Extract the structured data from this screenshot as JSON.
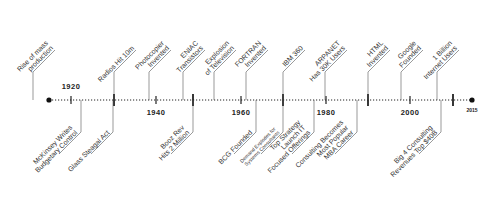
{
  "timeline": {
    "start_label": "",
    "end_label": "2015",
    "axis_color": "#222222",
    "line_color": "#555555",
    "text_color": "#333333",
    "years": [
      {
        "label": "1920",
        "x": 71,
        "pos": "above"
      },
      {
        "label": "1940",
        "x": 156,
        "pos": "below"
      },
      {
        "label": "1960",
        "x": 241,
        "pos": "below"
      },
      {
        "label": "1980",
        "x": 326,
        "pos": "below"
      },
      {
        "label": "2000",
        "x": 410,
        "pos": "below"
      }
    ],
    "top_events": [
      {
        "lines": [
          "Rise of mass",
          "production"
        ],
        "x": 33,
        "tick": false
      },
      {
        "lines": [
          "Radios Hit 10m"
        ],
        "x": 114,
        "tick": true
      },
      {
        "lines": [
          "Photocopier",
          "Invented"
        ],
        "x": 149,
        "tick": false
      },
      {
        "lines": [
          "ENIAC",
          "Transistors"
        ],
        "x": 183,
        "tick": false
      },
      {
        "lines": [
          "Explosion",
          "of Television"
        ],
        "x": 214,
        "tick": false
      },
      {
        "lines": [
          "FORTRAN",
          "Invented"
        ],
        "x": 246,
        "tick": false
      },
      {
        "lines": [
          "IBM 360"
        ],
        "x": 283,
        "tick": true
      },
      {
        "lines": [
          "ARPANET",
          "Has 30K Users"
        ],
        "x": 325,
        "tick": false
      },
      {
        "lines": [
          "HTML",
          "Invented"
        ],
        "x": 368,
        "tick": true
      },
      {
        "lines": [
          "Google",
          "Founded"
        ],
        "x": 401,
        "tick": false
      },
      {
        "lines": [
          "1 Billion",
          "Internet Users"
        ],
        "x": 437,
        "tick": false
      }
    ],
    "bottom_events": [
      {
        "lines": [
          "McKinsey Writes",
          "Budgetary Control"
        ],
        "x": 81,
        "small": false
      },
      {
        "lines": [
          "Glass Steagal Act"
        ],
        "x": 113,
        "small": false
      },
      {
        "lines": [
          "Booz Rev",
          "Hits 2 Million"
        ],
        "x": 193,
        "small": false
      },
      {
        "lines": [
          "BCG Founded"
        ],
        "x": 256,
        "small": false
      },
      {
        "lines": [
          "Demand Explodes for",
          "Systems Consultants"
        ],
        "x": 283,
        "small": true
      },
      {
        "lines": [
          "Top Strategy",
          "Launch IT",
          "Focused Offerings"
        ],
        "x": 314,
        "small": false
      },
      {
        "lines": [
          "Consulting Becomes",
          "Most Popular",
          "MBA Career"
        ],
        "x": 357,
        "small": false
      },
      {
        "lines": [
          "Big 4 Consulting",
          "Revenues Top $40B"
        ],
        "x": 441,
        "small": false
      }
    ],
    "major_ticks": [
      114,
      193,
      283,
      368,
      453
    ],
    "minor_ticks": [
      71,
      156,
      241,
      326,
      410
    ]
  }
}
